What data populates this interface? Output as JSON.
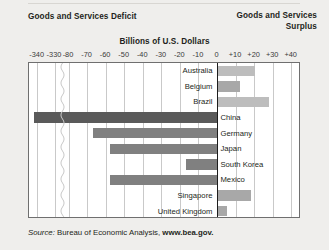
{
  "header": {
    "deficit_title": "Goods and Services Deficit",
    "surplus_title_line1": "Goods and Services",
    "surplus_title_line2": "Surplus"
  },
  "source": {
    "label": "Source:",
    "agency": " Bureau of Economic Analysis, ",
    "url": "www.bea.gov."
  },
  "colors": {
    "deficit_dark": "#5a5a5a",
    "deficit_mid": "#808080",
    "surplus_light": "#bdbdbd",
    "surplus_mid": "#a8a8a8",
    "plot_border": "#6f6f6f",
    "gridline": "#c9c9c9",
    "zeroline": "#1d1d1d",
    "background": "#efeeec"
  },
  "chart_data": {
    "type": "bar",
    "orientation": "horizontal",
    "title": "Billions of U.S. Dollars",
    "xlabel": "Billions of U.S. Dollars",
    "ylabel": "",
    "grid": true,
    "legend": false,
    "axis_break": {
      "from": -330,
      "to": -80
    },
    "tick_labels": [
      "-340",
      "-330",
      "-80",
      "-70",
      "-60",
      "-50",
      "-40",
      "-30",
      "-20",
      "-10",
      "0",
      "+10",
      "+20",
      "+30",
      "+40"
    ],
    "tick_values": [
      -340,
      -330,
      -80,
      -70,
      -60,
      -50,
      -40,
      -30,
      -20,
      -10,
      0,
      10,
      20,
      30,
      40
    ],
    "xlim": [
      -345,
      45
    ],
    "categories": [
      "Australia",
      "Belgium",
      "Brazil",
      "China",
      "Germany",
      "Japan",
      "South Korea",
      "Mexico",
      "Singapore",
      "United Kingdom"
    ],
    "values": [
      20,
      12,
      28,
      -342,
      -67,
      -58,
      -17,
      -58,
      18,
      5
    ],
    "series": [
      {
        "name": "Goods and Services Balance",
        "points": [
          {
            "category": "Australia",
            "value": 20,
            "kind": "surplus"
          },
          {
            "category": "Belgium",
            "value": 12,
            "kind": "surplus"
          },
          {
            "category": "Brazil",
            "value": 28,
            "kind": "surplus"
          },
          {
            "category": "China",
            "value": -342,
            "kind": "deficit"
          },
          {
            "category": "Germany",
            "value": -67,
            "kind": "deficit"
          },
          {
            "category": "Japan",
            "value": -58,
            "kind": "deficit"
          },
          {
            "category": "South Korea",
            "value": -17,
            "kind": "deficit"
          },
          {
            "category": "Mexico",
            "value": -58,
            "kind": "deficit"
          },
          {
            "category": "Singapore",
            "value": 18,
            "kind": "surplus"
          },
          {
            "category": "United Kingdom",
            "value": 5,
            "kind": "surplus"
          }
        ]
      }
    ]
  }
}
